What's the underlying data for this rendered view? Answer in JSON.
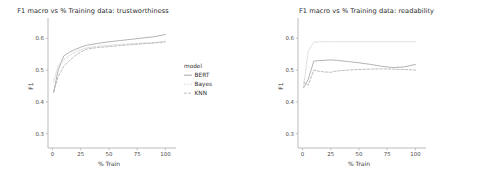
{
  "figure": {
    "background_color": "#ffffff",
    "facets": 2
  },
  "legend": {
    "title": "model",
    "position": "right-of-left-facet",
    "entries": [
      {
        "label": "BERT",
        "color": "#9a9a9a",
        "dash": "none"
      },
      {
        "label": "Bayes",
        "color": "#c9c9c9",
        "dash": "dotted"
      },
      {
        "label": "KNN",
        "color": "#aaaaaa",
        "dash": "dashed"
      }
    ]
  },
  "chart_data": [
    {
      "type": "line",
      "title": "F1 macro vs % Training data: trustworthiness",
      "xlabel": "% Train",
      "ylabel": "F1",
      "xlim": [
        -4,
        104
      ],
      "ylim": [
        0.255,
        0.645
      ],
      "xticks": [
        0,
        25,
        50,
        75,
        100
      ],
      "xtick_labels": [
        "0",
        "25",
        "50",
        "75",
        "100"
      ],
      "yticks": [
        0.3,
        0.4,
        0.5,
        0.6
      ],
      "ytick_labels": [
        "0.3",
        "0.4",
        "0.5",
        "0.6"
      ],
      "grid": false,
      "legend": "model",
      "x": [
        1,
        5,
        10,
        15,
        20,
        25,
        30,
        40,
        50,
        60,
        70,
        80,
        90,
        100
      ],
      "series": [
        {
          "name": "BERT",
          "color": "#9a9a9a",
          "dash": "none",
          "values": [
            0.43,
            0.5,
            0.545,
            0.556,
            0.565,
            0.572,
            0.578,
            0.584,
            0.589,
            0.593,
            0.597,
            0.601,
            0.605,
            0.612
          ]
        },
        {
          "name": "Bayes",
          "color": "#c9c9c9",
          "dash": "dotted",
          "values": [
            0.462,
            0.515,
            0.532,
            0.546,
            0.556,
            0.564,
            0.57,
            0.575,
            0.578,
            0.581,
            0.583,
            0.585,
            0.587,
            0.59
          ]
        },
        {
          "name": "KNN",
          "color": "#aaaaaa",
          "dash": "dashed",
          "values": [
            0.432,
            0.48,
            0.512,
            0.53,
            0.545,
            0.557,
            0.566,
            0.571,
            0.574,
            0.577,
            0.58,
            0.583,
            0.585,
            0.589
          ]
        }
      ]
    },
    {
      "type": "line",
      "title": "F1 macro vs % Training data: readability",
      "xlabel": "% Train",
      "ylabel": "F1",
      "xlim": [
        -4,
        104
      ],
      "ylim": [
        0.255,
        0.645
      ],
      "xticks": [
        0,
        25,
        50,
        75,
        100
      ],
      "xtick_labels": [
        "0",
        "25",
        "50",
        "75",
        "100"
      ],
      "yticks": [
        0.3,
        0.4,
        0.5,
        0.6
      ],
      "ytick_labels": [
        "0.3",
        "0.4",
        "0.5",
        "0.6"
      ],
      "grid": false,
      "legend": "model",
      "x": [
        1,
        5,
        10,
        15,
        20,
        25,
        30,
        40,
        50,
        60,
        70,
        80,
        90,
        100
      ],
      "series": [
        {
          "name": "BERT",
          "color": "#9a9a9a",
          "dash": "none",
          "values": [
            0.445,
            0.47,
            0.528,
            0.53,
            0.531,
            0.532,
            0.531,
            0.527,
            0.523,
            0.518,
            0.512,
            0.508,
            0.51,
            0.518
          ]
        },
        {
          "name": "Bayes",
          "color": "#c9c9c9",
          "dash": "dotted",
          "values": [
            0.448,
            0.56,
            0.588,
            0.589,
            0.589,
            0.589,
            0.589,
            0.589,
            0.589,
            0.589,
            0.589,
            0.589,
            0.589,
            0.589
          ]
        },
        {
          "name": "KNN",
          "color": "#aaaaaa",
          "dash": "dashed",
          "values": [
            0.462,
            0.452,
            0.5,
            0.496,
            0.494,
            0.493,
            0.497,
            0.5,
            0.502,
            0.503,
            0.504,
            0.503,
            0.502,
            0.5
          ]
        }
      ]
    }
  ]
}
